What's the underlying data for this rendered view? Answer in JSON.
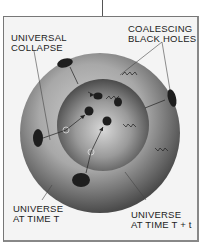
{
  "figure": {
    "type": "diagram",
    "labels": {
      "universal_collapse": "UNIVERSAL\nCOLLAPSE",
      "coalescing_black_holes": "COALESCING\nBLACK HOLES",
      "universe_time_t": "UNIVERSE\nAT TIME T",
      "universe_time_t_plus_t": "UNIVERSE\nAT TIME T + t"
    },
    "colors": {
      "outer_sphere": "#8a8a8a",
      "inner_sphere": "#6e6e6e",
      "black_hole": "#1e1e1e",
      "frame_border": "#777777",
      "background": "#f4f4f4"
    }
  }
}
